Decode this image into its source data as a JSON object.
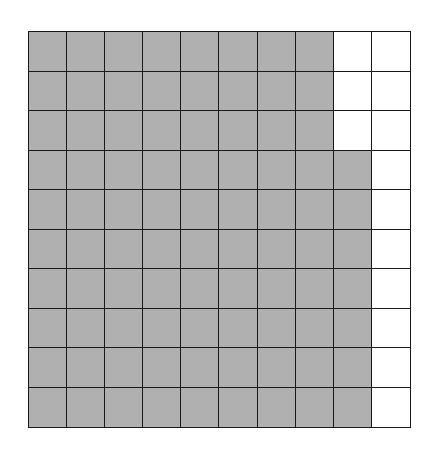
{
  "grid": {
    "rows": 10,
    "cols": 10,
    "shaded_color": "#b0b0b0",
    "unshaded_color": "#ffffff",
    "line_color": "#1a1a1a",
    "shaded_per_row": [
      8,
      8,
      8,
      9,
      9,
      9,
      9,
      9,
      9,
      9
    ],
    "total_shaded": 87,
    "total_cells": 100
  }
}
